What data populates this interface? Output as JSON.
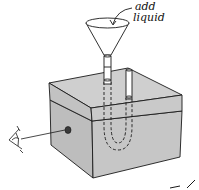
{
  "diagram": {
    "type": "illustration",
    "labels": {
      "add_line1": "add",
      "add_line2": "liquid"
    },
    "colors": {
      "box_fill": "#c4c4c4",
      "box_top": "#cdcdcd",
      "box_side": "#b9b9b9",
      "line": "#1a1a1a",
      "peephole": "#3a3a3a",
      "background": "#ffffff"
    },
    "components": [
      "funnel",
      "tube-left",
      "tube-right",
      "u-tube-hidden",
      "box-lid",
      "box-body",
      "peephole",
      "eye",
      "sight-line",
      "arrow-to-funnel"
    ]
  }
}
